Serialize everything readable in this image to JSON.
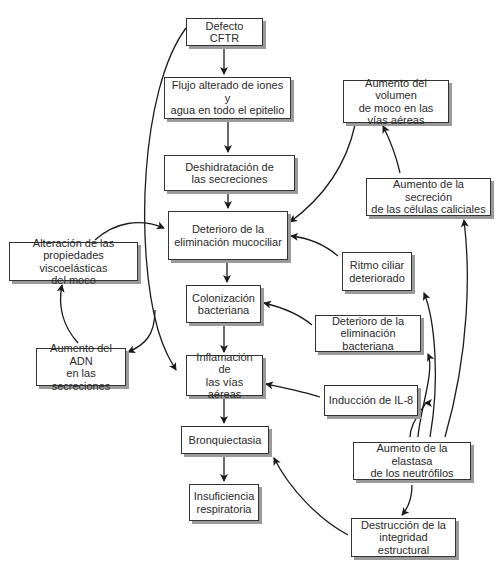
{
  "diagram": {
    "title_partial": "",
    "nodes": [
      {
        "id": "cftr",
        "label": "Defecto CFTR"
      },
      {
        "id": "flujo",
        "label": "Flujo alterado de iones y\nagua en todo el epitelio"
      },
      {
        "id": "deshid",
        "label": "Deshidratación de\nlas secreciones"
      },
      {
        "id": "mucocil",
        "label": "Deterioro de la\neliminación mucociliar"
      },
      {
        "id": "coloniz",
        "label": "Colonización\nbacteriana"
      },
      {
        "id": "inflam",
        "label": "Inflamación de\nlas vías aéreas"
      },
      {
        "id": "bronq",
        "label": "Bronquiectasia"
      },
      {
        "id": "insuf",
        "label": "Insuficiencia\nrespiratoria"
      },
      {
        "id": "volumen",
        "label": "Aumento del volumen\nde moco en las\nvías aéreas"
      },
      {
        "id": "caliciales",
        "label": "Aumento de la secreción\nde las células caliciales"
      },
      {
        "id": "ritmo",
        "label": "Ritmo ciliar\ndeteriorado"
      },
      {
        "id": "elimbact",
        "label": "Deterioro de la\neliminación bacteriana"
      },
      {
        "id": "il8",
        "label": "Inducción de IL-8"
      },
      {
        "id": "elastasa",
        "label": "Aumento de la elastasa\nde los neutrófilos"
      },
      {
        "id": "destruc",
        "label": "Destrucción de la\nintegridad estructural"
      },
      {
        "id": "viscoel",
        "label": "Alteración de las\npropiedades viscoelásticas\ndel moco"
      },
      {
        "id": "adn",
        "label": "Aumento del ADN\nen las secreciones"
      }
    ],
    "edges": [
      {
        "from": "cftr",
        "to": "flujo"
      },
      {
        "from": "flujo",
        "to": "deshid"
      },
      {
        "from": "deshid",
        "to": "mucocil"
      },
      {
        "from": "mucocil",
        "to": "coloniz"
      },
      {
        "from": "coloniz",
        "to": "inflam"
      },
      {
        "from": "inflam",
        "to": "bronq"
      },
      {
        "from": "bronq",
        "to": "insuf"
      },
      {
        "from": "cftr",
        "to": "inflam"
      },
      {
        "from": "cftr",
        "to": "adn"
      },
      {
        "from": "adn",
        "to": "viscoel"
      },
      {
        "from": "viscoel",
        "to": "mucocil"
      },
      {
        "from": "caliciales",
        "to": "volumen"
      },
      {
        "from": "volumen",
        "to": "mucocil"
      },
      {
        "from": "ritmo",
        "to": "mucocil"
      },
      {
        "from": "elimbact",
        "to": "coloniz"
      },
      {
        "from": "il8",
        "to": "inflam"
      },
      {
        "from": "elastasa",
        "to": "il8"
      },
      {
        "from": "elastasa",
        "to": "elimbact"
      },
      {
        "from": "elastasa",
        "to": "ritmo"
      },
      {
        "from": "elastasa",
        "to": "caliciales"
      },
      {
        "from": "elastasa",
        "to": "destruc"
      },
      {
        "from": "destruc",
        "to": "bronq"
      }
    ]
  }
}
